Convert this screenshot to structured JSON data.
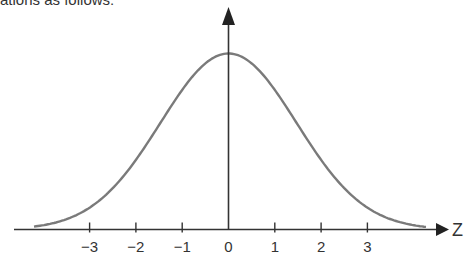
{
  "caption": "ations as follows:",
  "chart_data": {
    "type": "line",
    "title": "",
    "xlabel": "Z",
    "ylabel": "",
    "x_ticks": [
      -3,
      -2,
      -1,
      0,
      1,
      2,
      3
    ],
    "x_tick_labels": [
      "−3",
      "−2",
      "−1",
      "0",
      "1",
      "2",
      "3"
    ],
    "xlim": [
      -4.6,
      4.8
    ],
    "grid": false,
    "legend": null,
    "series": [
      {
        "name": "normal density",
        "x": [
          -4,
          -3,
          -2,
          -1,
          0,
          1,
          2,
          3,
          4
        ],
        "y_relative": [
          0.03,
          0.15,
          0.42,
          0.78,
          1.0,
          0.78,
          0.42,
          0.15,
          0.03
        ],
        "color": "#7a7a7a"
      }
    ],
    "axis_color": "#333333"
  }
}
